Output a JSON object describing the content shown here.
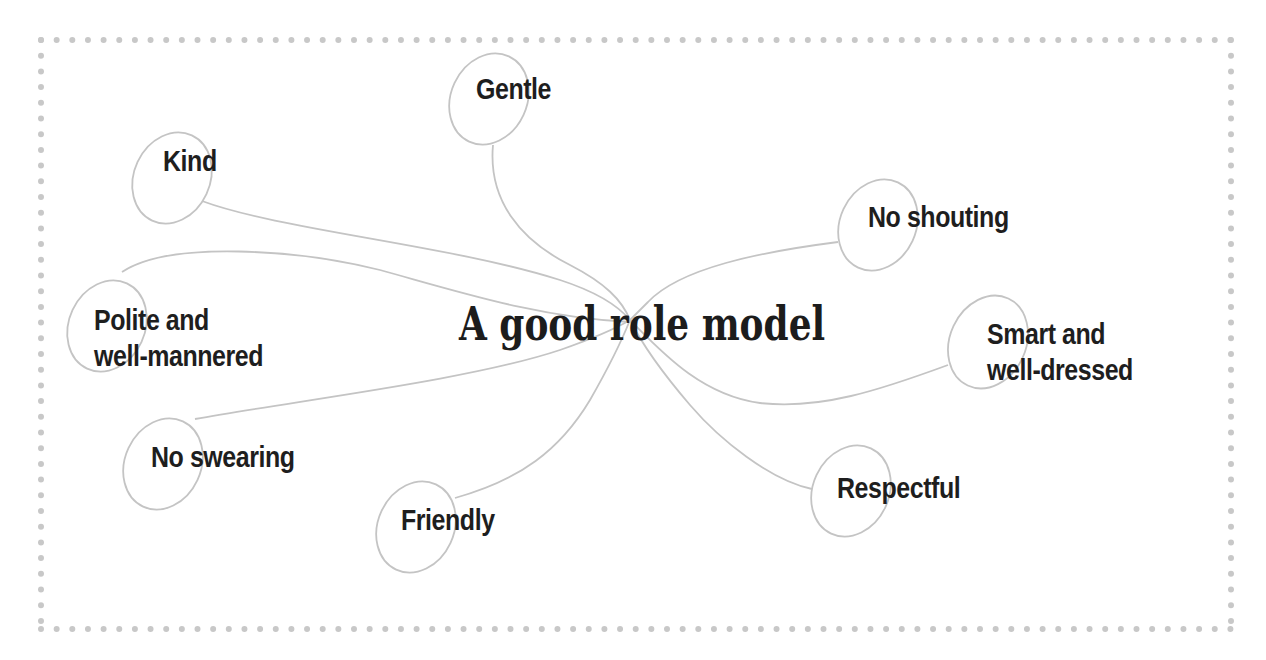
{
  "diagram": {
    "type": "mind-map",
    "center": {
      "label": "A good role model",
      "hub": [
        630,
        320
      ]
    },
    "nodes": [
      {
        "id": "gentle",
        "label_lines": [
          "Gentle"
        ]
      },
      {
        "id": "kind",
        "label_lines": [
          "Kind"
        ]
      },
      {
        "id": "no-shouting",
        "label_lines": [
          "No shouting"
        ]
      },
      {
        "id": "polite",
        "label_lines": [
          "Polite and",
          "well-mannered"
        ]
      },
      {
        "id": "smart",
        "label_lines": [
          "Smart and",
          "well-dressed"
        ]
      },
      {
        "id": "no-swearing",
        "label_lines": [
          "No swearing"
        ]
      },
      {
        "id": "friendly",
        "label_lines": [
          "Friendly"
        ]
      },
      {
        "id": "respectful",
        "label_lines": [
          "Respectful"
        ]
      }
    ],
    "colors": {
      "border_dots": "#c8c8c8",
      "connector": "#c4c4c4",
      "bubble_outline": "#c4c4c4",
      "text": "#1e1e1e",
      "background": "#ffffff"
    }
  }
}
